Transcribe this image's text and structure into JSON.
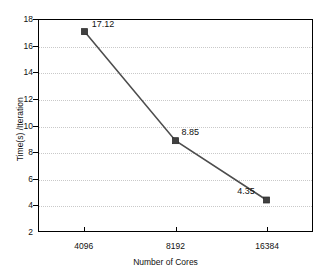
{
  "chart_data": {
    "type": "line",
    "title": "",
    "subtitle": "",
    "xlabel": "Number of Cores",
    "ylabel": "Time(s) /Iteration",
    "categories": [
      "4096",
      "8192",
      "16384"
    ],
    "values": [
      17.12,
      4.35,
      8.85
    ],
    "series": [
      {
        "name": "",
        "values": [
          17.12,
          8.85,
          4.35
        ],
        "point_labels": [
          "17.12",
          "8.85",
          "4.35"
        ],
        "line_color": "#4d4d4d",
        "marker": "square",
        "marker_color": "#404040"
      }
    ],
    "ylim": [
      2,
      18
    ],
    "y_ticks": [
      2,
      4,
      6,
      8,
      10,
      12,
      14,
      16,
      18
    ],
    "y_tick_labels": [
      "2",
      "4",
      "6",
      "8",
      "10",
      "12",
      "14",
      "16",
      "18"
    ],
    "x_ticks": [
      "4096",
      "8192",
      "16384"
    ],
    "x_tick_labels": [
      "4096",
      "8192",
      "16384"
    ],
    "grid": {
      "horizontal": true,
      "vertical": false,
      "style": "dotted",
      "color": "#c9c9c9"
    },
    "legend": {
      "visible": false,
      "position": "none",
      "entries": []
    },
    "frame": {
      "visible": true,
      "color": "#000000"
    },
    "background_color": "#ffffff"
  }
}
